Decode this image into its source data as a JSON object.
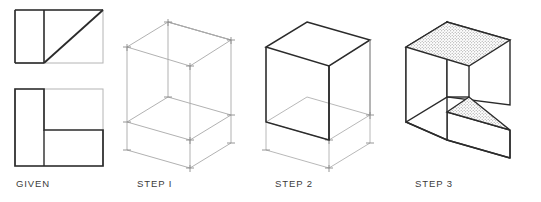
{
  "figure": {
    "title_present": false,
    "background_color": "#ffffff",
    "line_color_dark": "#2b2b2b",
    "line_color_light": "#9a9a9a",
    "line_color_mid": "#6e6e6e",
    "shade_fill": "#d9d9d9",
    "caption_color": "#3b3b3b"
  },
  "panels": [
    {
      "id": "given",
      "caption": "GIVEN",
      "description": "Two orthographic views: top view with diagonal, front view L-shape"
    },
    {
      "id": "step1",
      "caption": "STEP I",
      "description": "Light isometric construction box enclosing the object"
    },
    {
      "id": "step2",
      "caption": "STEP 2",
      "description": "Vertical slab blocked in, construction lines retained"
    },
    {
      "id": "step3",
      "caption": "STEP 3",
      "description": "Finished solid with shaded top face and inclined triangular surface"
    }
  ],
  "captions": {
    "given": "GIVEN",
    "step1": "STEP I",
    "step2": "STEP 2",
    "step3": "STEP 3"
  }
}
